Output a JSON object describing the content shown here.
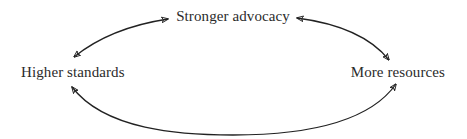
{
  "diagram": {
    "type": "cycle",
    "nodes": [
      {
        "id": "top",
        "label": "Stronger advocacy"
      },
      {
        "id": "left",
        "label": "Higher standards"
      },
      {
        "id": "right",
        "label": "More resources"
      }
    ],
    "edges": [
      {
        "from": "left",
        "to": "top",
        "direction": "bidirectional",
        "style": "curved-arrow"
      },
      {
        "from": "top",
        "to": "right",
        "direction": "bidirectional",
        "style": "curved-arrow"
      },
      {
        "from": "left",
        "to": "right",
        "direction": "bidirectional",
        "style": "curved-arrow-bottom"
      }
    ],
    "colors": {
      "text": "#2b2b2b",
      "arrow": "#222222",
      "background": "#ffffff"
    }
  }
}
